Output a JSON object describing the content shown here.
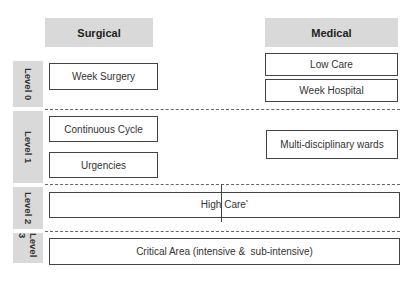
{
  "columns": {
    "surgical": "Surgical",
    "medical": "Medical"
  },
  "levels": [
    {
      "label": "Level 0"
    },
    {
      "label": "Level 1"
    },
    {
      "label": "Level 2"
    },
    {
      "label": "Level 3"
    }
  ],
  "boxes": {
    "week_surgery": "Week Surgery",
    "low_care": "Low Care",
    "week_hospital": "Week Hospital",
    "continuous_cycle": "Continuous Cycle",
    "urgencies": "Urgencies",
    "multidisciplinary": "Multi-disciplinary wards",
    "high_care": "High Care",
    "high_care_mark": "*",
    "critical_area": "Critical Area (intensive &  sub-intensive)"
  }
}
